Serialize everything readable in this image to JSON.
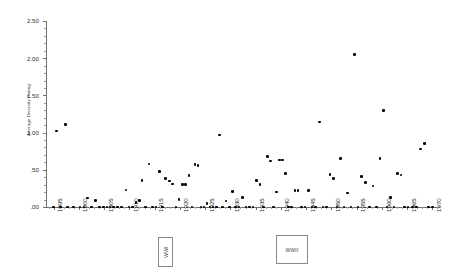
{
  "chart_data": {
    "type": "scatter",
    "title": "",
    "xlabel": "",
    "ylabel": "Average Diversity Rating",
    "xlim": [
      1893.5,
      1971.5
    ],
    "ylim": [
      0.0,
      2.5
    ],
    "grid": false,
    "legend": null,
    "y_ticks": [
      {
        "value": 2.5,
        "label": "2.50"
      },
      {
        "value": 2.0,
        "label": "2.00"
      },
      {
        "value": 1.5,
        "label": "1.50"
      },
      {
        "value": 1.0,
        "label": "1.00"
      },
      {
        "value": 0.5,
        "label": ".50"
      },
      {
        "value": 0.0,
        "label": ".00"
      }
    ],
    "x_ticks": [
      {
        "value": 1895,
        "label": "1895"
      },
      {
        "value": 1900,
        "label": "1900"
      },
      {
        "value": 1905,
        "label": "1905"
      },
      {
        "value": 1910,
        "label": "1910"
      },
      {
        "value": 1915,
        "label": "1915"
      },
      {
        "value": 1920,
        "label": "1920"
      },
      {
        "value": 1925,
        "label": "1925"
      },
      {
        "value": 1930,
        "label": "1930"
      },
      {
        "value": 1935,
        "label": "1935"
      },
      {
        "value": 1940,
        "label": "1940"
      },
      {
        "value": 1945,
        "label": "1945"
      },
      {
        "value": 1950,
        "label": "1950"
      },
      {
        "value": 1955,
        "label": "1955"
      },
      {
        "value": 1960,
        "label": "1960"
      },
      {
        "value": 1965,
        "label": "1965"
      },
      {
        "value": 1970,
        "label": "1970"
      }
    ],
    "annotations": [
      {
        "name": "wwi",
        "text": "WWI",
        "x": 1917,
        "orientation": "vertical"
      },
      {
        "name": "wwii",
        "text": "WWII",
        "x": 1942,
        "orientation": "horizontal"
      }
    ],
    "points": [
      {
        "x": 1895.0,
        "y": 0.0
      },
      {
        "x": 1895.6,
        "y": 1.02
      },
      {
        "x": 1896.4,
        "y": 0.0
      },
      {
        "x": 1897.4,
        "y": 1.11
      },
      {
        "x": 1897.8,
        "y": 0.0
      },
      {
        "x": 1899.0,
        "y": 0.0
      },
      {
        "x": 1900.2,
        "y": 0.0
      },
      {
        "x": 1901.0,
        "y": 0.0
      },
      {
        "x": 1901.7,
        "y": 0.12
      },
      {
        "x": 1902.5,
        "y": 0.0
      },
      {
        "x": 1903.3,
        "y": 0.09
      },
      {
        "x": 1904.1,
        "y": 0.0
      },
      {
        "x": 1904.9,
        "y": 0.0
      },
      {
        "x": 1905.6,
        "y": 0.0
      },
      {
        "x": 1906.2,
        "y": 0.0
      },
      {
        "x": 1906.9,
        "y": 0.0
      },
      {
        "x": 1907.6,
        "y": 0.0
      },
      {
        "x": 1908.4,
        "y": 0.0
      },
      {
        "x": 1909.3,
        "y": 0.23
      },
      {
        "x": 1909.9,
        "y": 0.0
      },
      {
        "x": 1910.6,
        "y": 0.0
      },
      {
        "x": 1911.3,
        "y": 0.06
      },
      {
        "x": 1912.0,
        "y": 0.09
      },
      {
        "x": 1912.5,
        "y": 0.36
      },
      {
        "x": 1913.2,
        "y": 0.0
      },
      {
        "x": 1913.9,
        "y": 0.58
      },
      {
        "x": 1914.6,
        "y": 0.0
      },
      {
        "x": 1915.3,
        "y": 0.0
      },
      {
        "x": 1916.0,
        "y": 0.48
      },
      {
        "x": 1916.6,
        "y": 0.0
      },
      {
        "x": 1917.2,
        "y": 0.38
      },
      {
        "x": 1917.9,
        "y": 0.35
      },
      {
        "x": 1918.6,
        "y": 0.31
      },
      {
        "x": 1919.2,
        "y": 0.0
      },
      {
        "x": 1919.8,
        "y": 0.1
      },
      {
        "x": 1920.5,
        "y": 0.3
      },
      {
        "x": 1921.1,
        "y": 0.3
      },
      {
        "x": 1921.8,
        "y": 0.42
      },
      {
        "x": 1922.4,
        "y": 0.0
      },
      {
        "x": 1923.0,
        "y": 0.57
      },
      {
        "x": 1923.6,
        "y": 0.56
      },
      {
        "x": 1924.2,
        "y": 0.0
      },
      {
        "x": 1924.8,
        "y": 0.0
      },
      {
        "x": 1925.4,
        "y": 0.05
      },
      {
        "x": 1926.0,
        "y": 0.0
      },
      {
        "x": 1926.6,
        "y": 0.0
      },
      {
        "x": 1927.2,
        "y": 0.0
      },
      {
        "x": 1927.8,
        "y": 0.97
      },
      {
        "x": 1928.5,
        "y": 0.0
      },
      {
        "x": 1929.1,
        "y": 0.08
      },
      {
        "x": 1929.8,
        "y": 0.0
      },
      {
        "x": 1930.4,
        "y": 0.21
      },
      {
        "x": 1931.0,
        "y": 0.0
      },
      {
        "x": 1931.7,
        "y": 0.0
      },
      {
        "x": 1932.4,
        "y": 0.13
      },
      {
        "x": 1933.1,
        "y": 0.0
      },
      {
        "x": 1933.8,
        "y": 0.0
      },
      {
        "x": 1934.5,
        "y": 0.0
      },
      {
        "x": 1935.2,
        "y": 0.36
      },
      {
        "x": 1935.9,
        "y": 0.3
      },
      {
        "x": 1936.6,
        "y": 0.0
      },
      {
        "x": 1937.3,
        "y": 0.68
      },
      {
        "x": 1937.9,
        "y": 0.62
      },
      {
        "x": 1938.5,
        "y": 0.0
      },
      {
        "x": 1939.1,
        "y": 0.2
      },
      {
        "x": 1939.7,
        "y": 0.63
      },
      {
        "x": 1940.3,
        "y": 0.63
      },
      {
        "x": 1940.9,
        "y": 0.45
      },
      {
        "x": 1941.5,
        "y": 0.0
      },
      {
        "x": 1942.1,
        "y": 0.0
      },
      {
        "x": 1942.8,
        "y": 0.22
      },
      {
        "x": 1943.4,
        "y": 0.22
      },
      {
        "x": 1944.1,
        "y": 0.0
      },
      {
        "x": 1944.8,
        "y": 0.0
      },
      {
        "x": 1945.5,
        "y": 0.22
      },
      {
        "x": 1946.2,
        "y": 0.0
      },
      {
        "x": 1946.9,
        "y": 0.0
      },
      {
        "x": 1947.6,
        "y": 1.14
      },
      {
        "x": 1948.3,
        "y": 0.0
      },
      {
        "x": 1949.0,
        "y": 0.0
      },
      {
        "x": 1949.7,
        "y": 0.44
      },
      {
        "x": 1950.4,
        "y": 0.38
      },
      {
        "x": 1951.1,
        "y": 0.0
      },
      {
        "x": 1951.8,
        "y": 0.65
      },
      {
        "x": 1952.5,
        "y": 0.0
      },
      {
        "x": 1953.2,
        "y": 0.19
      },
      {
        "x": 1953.9,
        "y": 0.0
      },
      {
        "x": 1954.6,
        "y": 2.05
      },
      {
        "x": 1955.3,
        "y": 0.0
      },
      {
        "x": 1956.0,
        "y": 0.41
      },
      {
        "x": 1956.8,
        "y": 0.33
      },
      {
        "x": 1957.5,
        "y": 0.0
      },
      {
        "x": 1958.2,
        "y": 0.28
      },
      {
        "x": 1958.9,
        "y": 0.0
      },
      {
        "x": 1959.6,
        "y": 0.65
      },
      {
        "x": 1960.3,
        "y": 1.3
      },
      {
        "x": 1961.0,
        "y": 0.0
      },
      {
        "x": 1961.7,
        "y": 0.13
      },
      {
        "x": 1962.4,
        "y": 0.0
      },
      {
        "x": 1963.1,
        "y": 0.45
      },
      {
        "x": 1963.8,
        "y": 0.43
      },
      {
        "x": 1964.5,
        "y": 0.0
      },
      {
        "x": 1965.2,
        "y": 0.0
      },
      {
        "x": 1966.0,
        "y": 0.0
      },
      {
        "x": 1966.8,
        "y": 0.0
      },
      {
        "x": 1967.6,
        "y": 0.78
      },
      {
        "x": 1968.4,
        "y": 0.85
      },
      {
        "x": 1969.2,
        "y": 0.0
      },
      {
        "x": 1970.0,
        "y": 0.0
      }
    ]
  }
}
